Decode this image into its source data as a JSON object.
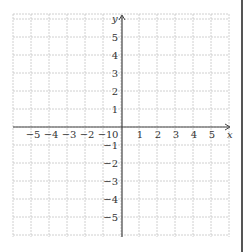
{
  "diagram": {
    "type": "coordinate-plane",
    "x_axis": {
      "label": "x",
      "min": -6,
      "max": 6,
      "tick_labels": [
        "−5",
        "−4",
        "−3",
        "−2",
        "−1",
        "0",
        "1",
        "2",
        "3",
        "4",
        "5"
      ],
      "tick_values": [
        -5,
        -4,
        -3,
        -2,
        -1,
        0,
        1,
        2,
        3,
        4,
        5
      ]
    },
    "y_axis": {
      "label": "y",
      "min": -6,
      "max": 6,
      "tick_labels": [
        "5",
        "4",
        "3",
        "2",
        "1",
        "−1",
        "−2",
        "−3",
        "−4",
        "−5"
      ],
      "tick_values": [
        5,
        4,
        3,
        2,
        1,
        -1,
        -2,
        -3,
        -4,
        -5
      ]
    },
    "grid": {
      "style": "dashed",
      "color": "#bbbbbb",
      "cells_x": 12,
      "cells_y": 12
    },
    "colors": {
      "axis": "#444444",
      "grid": "#bbbbbb"
    }
  }
}
